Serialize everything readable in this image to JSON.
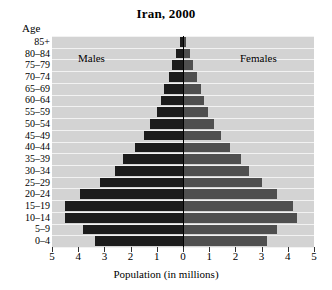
{
  "chart_data": {
    "type": "bar",
    "subtype": "population-pyramid",
    "title": "Iran, 2000",
    "xlabel": "Population (in millions)",
    "ylabel": "Age",
    "xlim": [
      -5,
      5
    ],
    "x_tick_labels": [
      "5",
      "4",
      "3",
      "2",
      "1",
      "0",
      "1",
      "2",
      "3",
      "4",
      "5"
    ],
    "x_tick_values": [
      -5,
      -4,
      -3,
      -2,
      -1,
      0,
      1,
      2,
      3,
      4,
      5
    ],
    "grid": true,
    "legend_position": "in-plot",
    "categories": [
      "85+",
      "80–84",
      "75–79",
      "70–74",
      "65–69",
      "60–64",
      "55–59",
      "50–54",
      "45–49",
      "40–44",
      "35–39",
      "30–34",
      "25–29",
      "20–24",
      "15–19",
      "10–14",
      "5–9",
      "0–4"
    ],
    "series": [
      {
        "name": "Males",
        "color": "#1c1c1c",
        "side": "left",
        "values": [
          0.12,
          0.28,
          0.42,
          0.55,
          0.72,
          0.85,
          1.0,
          1.25,
          1.5,
          1.85,
          2.3,
          2.6,
          3.15,
          3.95,
          4.5,
          4.5,
          3.8,
          3.35
        ]
      },
      {
        "name": "Females",
        "color": "#4f4f4f",
        "side": "right",
        "values": [
          0.12,
          0.25,
          0.4,
          0.52,
          0.68,
          0.8,
          0.95,
          1.2,
          1.45,
          1.8,
          2.2,
          2.5,
          3.0,
          3.6,
          4.2,
          4.35,
          3.6,
          3.2
        ]
      }
    ]
  },
  "labels": {
    "age_header": "Age",
    "males": "Males",
    "females": "Females"
  },
  "colors": {
    "plot_background": "#d3d3d3",
    "gridline": "#f2f2f2",
    "male_bar": "#1c1c1c",
    "female_bar": "#4f4f4f",
    "axis": "#000000"
  }
}
